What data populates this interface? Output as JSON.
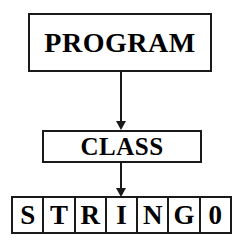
{
  "diagram": {
    "type": "flowchart",
    "background_color": "#ffffff",
    "stroke_color": "#1a1a1a",
    "text_color": "#000000",
    "nodes": [
      {
        "id": "program",
        "label": "PROGRAM",
        "shape": "rectangle"
      },
      {
        "id": "class",
        "label": "CLASS",
        "shape": "rectangle"
      },
      {
        "id": "string",
        "label": "STRING0",
        "shape": "cell-array"
      }
    ],
    "edges": [
      {
        "from": "PROGRAM",
        "to": "CLASS",
        "style": "solid-arrow-down"
      },
      {
        "from": "CLASS",
        "to": "STRING0",
        "style": "solid-arrow-down"
      }
    ],
    "string_cells": [
      {
        "char": "S"
      },
      {
        "char": "T"
      },
      {
        "char": "R"
      },
      {
        "char": "I"
      },
      {
        "char": "N"
      },
      {
        "char": "G"
      },
      {
        "char": "0"
      }
    ]
  }
}
